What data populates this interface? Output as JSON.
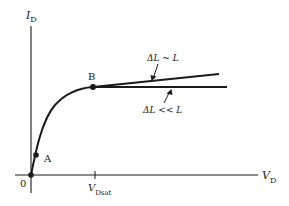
{
  "figure": {
    "type": "MOSFET output characteristic (I_D vs V_D)",
    "axes": {
      "y_label": {
        "main": "I",
        "sub": "D"
      },
      "x_label": {
        "main": "V",
        "sub": "D"
      },
      "origin_label": "0",
      "x_tick": {
        "main": "V",
        "sub": "Dsat"
      }
    },
    "points": [
      {
        "label": "A"
      },
      {
        "label": "B"
      }
    ],
    "annotations": {
      "upper": "ΔL ~ L",
      "lower": "ΔL << L"
    },
    "colors": {
      "line": "#1a1a1a",
      "background": "#ffffff"
    }
  }
}
